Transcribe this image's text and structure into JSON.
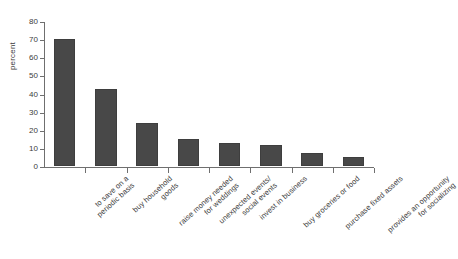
{
  "figure": {
    "ghost_text_top": "",
    "ghost_text_bottom": ""
  },
  "axis": {
    "ylabel": "percent",
    "yticks": [
      "0",
      "10",
      "20",
      "30",
      "40",
      "50",
      "60",
      "70",
      "80"
    ]
  },
  "colors": {
    "bar_fill": "#484848",
    "bar_edge": "#3e3e3e",
    "axis": "#6f6f6f",
    "text": "#3c3c3c"
  },
  "chart_data": {
    "type": "bar",
    "title": "",
    "xlabel": "",
    "ylabel": "percent",
    "ylim": [
      0,
      80
    ],
    "ytick_step": 10,
    "grid": false,
    "legend": false,
    "orientation": "vertical",
    "categories": [
      "to save on a periodic basis",
      "buy household goods",
      "raise money needed for weddings",
      "unexpected events/ social events",
      "invest in business",
      "buy groceries or food",
      "purchase fixed assets",
      "provides an opportunity for socializing"
    ],
    "category_lines": [
      [
        "to save on a",
        "periodic basis"
      ],
      [
        "buy household",
        "goods"
      ],
      [
        "raise money needed",
        "for weddings"
      ],
      [
        "unexpected events/",
        "social events"
      ],
      [
        "invest in business"
      ],
      [
        "buy groceries or food"
      ],
      [
        "purchase fixed assets"
      ],
      [
        "provides an opportunity",
        "for socializing"
      ]
    ],
    "values": [
      70,
      42.5,
      24,
      15,
      12.5,
      11.5,
      7,
      5
    ]
  }
}
